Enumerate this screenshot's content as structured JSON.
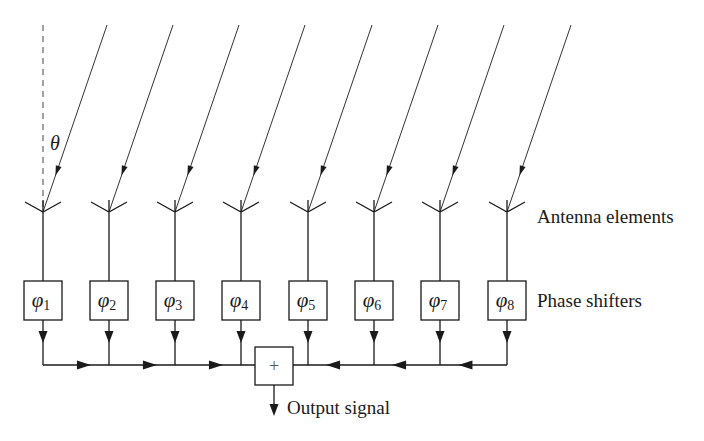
{
  "diagram": {
    "angle_label": "θ",
    "labels": {
      "antenna_elements": "Antenna elements",
      "phase_shifters": "Phase shifters",
      "output_signal": "Output signal",
      "summer_symbol": "+"
    },
    "element_count": 8,
    "elements": [
      {
        "index": 1,
        "phase_symbol": "φ",
        "subscript": "1",
        "x": 43
      },
      {
        "index": 2,
        "phase_symbol": "φ",
        "subscript": "2",
        "x": 109
      },
      {
        "index": 3,
        "phase_symbol": "φ",
        "subscript": "3",
        "x": 175
      },
      {
        "index": 4,
        "phase_symbol": "φ",
        "subscript": "4",
        "x": 241
      },
      {
        "index": 5,
        "phase_symbol": "φ",
        "subscript": "5",
        "x": 308
      },
      {
        "index": 6,
        "phase_symbol": "φ",
        "subscript": "6",
        "x": 374
      },
      {
        "index": 7,
        "phase_symbol": "φ",
        "subscript": "7",
        "x": 440
      },
      {
        "index": 8,
        "phase_symbol": "φ",
        "subscript": "8",
        "x": 507
      }
    ],
    "colors": {
      "line": "#1a1a1a",
      "ray": "#333333",
      "background": "#ffffff"
    }
  }
}
